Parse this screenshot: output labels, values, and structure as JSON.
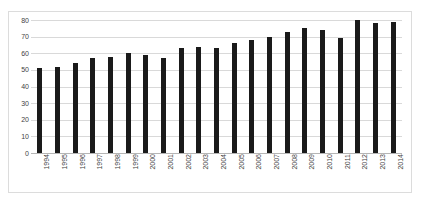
{
  "chart_data": {
    "type": "bar",
    "title": "",
    "xlabel": "",
    "ylabel": "",
    "ylim": [
      0,
      80
    ],
    "ytick_labels": [
      "80",
      "70",
      "60",
      "50",
      "40",
      "30",
      "20",
      "10",
      "0"
    ],
    "yticks": [
      80,
      70,
      60,
      50,
      40,
      30,
      20,
      10,
      0
    ],
    "grid": true,
    "legend": "none",
    "bar_color": "#1a1a1a",
    "gridline_color": "#d9d9d9",
    "categories": [
      "1994",
      "1995",
      "1996",
      "1997",
      "1998",
      "1999",
      "2000",
      "2001",
      "2002",
      "2003",
      "2004",
      "2005",
      "2006",
      "2007",
      "2008",
      "2009",
      "2010",
      "2011",
      "2012",
      "2013",
      "2014"
    ],
    "values": [
      51,
      52,
      54,
      57,
      58,
      60,
      59,
      57,
      63,
      64,
      63,
      66,
      68,
      70,
      73,
      75,
      74,
      69,
      80,
      78,
      79
    ]
  }
}
